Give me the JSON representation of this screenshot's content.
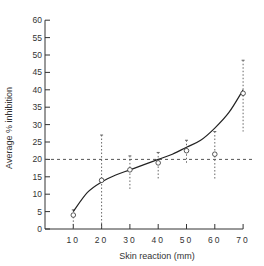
{
  "chart_data": {
    "type": "line",
    "title": "",
    "xlabel": "Skin reaction (mm)",
    "ylabel": "Average % inhibition",
    "xlim": [
      0,
      70
    ],
    "ylim": [
      0,
      60
    ],
    "x_ticks": [
      10,
      20,
      30,
      40,
      50,
      60,
      70
    ],
    "y_ticks": [
      0,
      5,
      10,
      15,
      20,
      25,
      30,
      35,
      40,
      45,
      50,
      55,
      60
    ],
    "grid": false,
    "legend": null,
    "reference_line": {
      "y": 20,
      "style": "dashed"
    },
    "series": [
      {
        "name": "Average % inhibition",
        "x": [
          10,
          20,
          30,
          40,
          50,
          60,
          70
        ],
        "values": [
          4,
          14,
          17,
          19,
          22.5,
          21.5,
          39
        ],
        "error_low": [
          0,
          0,
          11,
          14.5,
          19,
          14,
          28
        ],
        "error_high": [
          5.5,
          27,
          21,
          22,
          25.5,
          28,
          48.5
        ]
      }
    ],
    "fit_curve": {
      "style": "solid",
      "x": [
        10,
        15,
        20,
        25,
        30,
        35,
        40,
        45,
        50,
        55,
        60,
        65,
        70
      ],
      "y": [
        5,
        10.5,
        13.5,
        15.5,
        17,
        18.5,
        20,
        21.5,
        23.5,
        25.5,
        29,
        33.5,
        40
      ]
    }
  }
}
